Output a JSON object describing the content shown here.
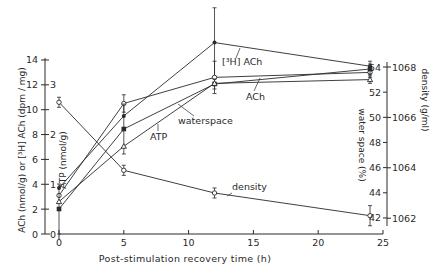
{
  "chart_data": {
    "type": "line",
    "title": "",
    "xlabel": "Post-stimulation recovery time (h)",
    "x_ticks": [
      0,
      5,
      10,
      15,
      20,
      25
    ],
    "xlim": [
      0,
      25
    ],
    "axes": {
      "left_outer": {
        "label": "ACh (nmol/g) or [³H] ACh (dpm / mg)",
        "ticks": [
          0,
          2,
          4,
          6,
          8,
          10,
          12,
          14
        ],
        "range": [
          0,
          14
        ]
      },
      "left_inner": {
        "label": "ATP (nmol/g)",
        "ticks": [
          0,
          1,
          2,
          3
        ],
        "range": [
          0,
          3.5
        ]
      },
      "right_inner": {
        "label": "water space (%)",
        "ticks": [
          42,
          44,
          46,
          48,
          50,
          52,
          54
        ],
        "range": [
          41,
          54.5
        ]
      },
      "right_outer": {
        "label": "density (g/ml)",
        "ticks": [
          1062,
          1064,
          1066,
          1068
        ],
        "range": [
          1061.6,
          1068.2
        ]
      }
    },
    "series": [
      {
        "name": "[³H]ACh",
        "marker": "filled-circle",
        "axis": "left_outer",
        "x": [
          0,
          5,
          12,
          24
        ],
        "values": [
          3.7,
          9.5,
          15.4,
          13.5
        ],
        "error": [
          0,
          0,
          2.8,
          0.4
        ]
      },
      {
        "name": "ACh",
        "marker": "open-circle",
        "axis": "left_outer",
        "x": [
          0,
          5,
          12,
          24
        ],
        "values": [
          3.1,
          10.5,
          12.6,
          13.0
        ],
        "error": [
          0,
          0.7,
          1.3,
          0.4
        ]
      },
      {
        "name": "ATP",
        "marker": "filled-square",
        "axis": "left_inner",
        "x": [
          0,
          5,
          12,
          24
        ],
        "values": [
          0.5,
          2.1,
          3.0,
          3.3
        ],
        "error": [
          0.5,
          0.5,
          0.1,
          0.1
        ]
      },
      {
        "name": "waterspace",
        "marker": "open-triangle",
        "axis": "right_inner",
        "x": [
          0,
          5,
          12,
          24
        ],
        "values": [
          43.3,
          47.7,
          52.7,
          53.0
        ],
        "error": [
          0,
          0,
          0,
          0.3
        ]
      },
      {
        "name": "density",
        "marker": "open-circle",
        "axis": "right_outer",
        "x": [
          0,
          5,
          12,
          24
        ],
        "values": [
          1066.6,
          1063.9,
          1063.0,
          1062.1
        ],
        "error": [
          0.2,
          0.2,
          0.2,
          0.4
        ]
      }
    ],
    "annotations": [
      "[³H] ACh",
      "ACh",
      "waterspace",
      "ATP",
      "density"
    ],
    "grid": false,
    "legend": "inline labels"
  }
}
